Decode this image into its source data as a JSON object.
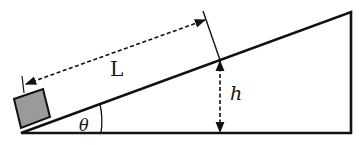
{
  "figure": {
    "labels": {
      "length": "L",
      "height": "h",
      "angle": "θ"
    },
    "colors": {
      "line": "#111111",
      "block_fill": "#9a9a9a",
      "background": "#ffffff"
    },
    "elements": [
      {
        "name": "incline-triangle",
        "kind": "right triangle, right angle at bottom-right"
      },
      {
        "name": "block",
        "kind": "square resting at bottom of incline"
      },
      {
        "name": "length-dimension",
        "kind": "dashed double arrow parallel to incline"
      },
      {
        "name": "height-dimension",
        "kind": "dashed vertical double arrow"
      },
      {
        "name": "angle-arc",
        "kind": "arc at bottom-left vertex"
      }
    ]
  }
}
